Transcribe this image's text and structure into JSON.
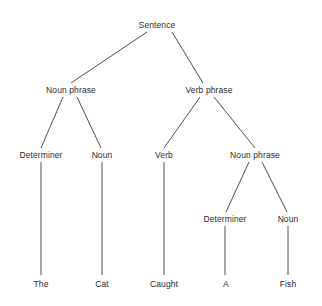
{
  "diagram": {
    "type": "parse-tree",
    "nodes": [
      {
        "id": "s",
        "label": "Sentence",
        "x": 157,
        "y": 25
      },
      {
        "id": "np1",
        "label": "Noun phrase",
        "x": 71,
        "y": 90
      },
      {
        "id": "vp",
        "label": "Verb phrase",
        "x": 209,
        "y": 90
      },
      {
        "id": "det1",
        "label": "Determiner",
        "x": 41,
        "y": 155
      },
      {
        "id": "n1",
        "label": "Noun",
        "x": 102,
        "y": 155
      },
      {
        "id": "v",
        "label": "Verb",
        "x": 164,
        "y": 155
      },
      {
        "id": "np2",
        "label": "Noun phrase",
        "x": 255,
        "y": 155
      },
      {
        "id": "det2",
        "label": "Determiner",
        "x": 225,
        "y": 219
      },
      {
        "id": "n2",
        "label": "Noun",
        "x": 288,
        "y": 219
      },
      {
        "id": "w1",
        "label": "The",
        "x": 41,
        "y": 284
      },
      {
        "id": "w2",
        "label": "Cat",
        "x": 102,
        "y": 284
      },
      {
        "id": "w3",
        "label": "Caught",
        "x": 164,
        "y": 284
      },
      {
        "id": "w4",
        "label": "A",
        "x": 226,
        "y": 284
      },
      {
        "id": "w5",
        "label": "Fish",
        "x": 288,
        "y": 284
      }
    ],
    "edges": [
      {
        "from": "s",
        "to": "np1",
        "x1": 147,
        "y1": 32,
        "x2": 71,
        "y2": 83
      },
      {
        "from": "s",
        "to": "vp",
        "x1": 172,
        "y1": 32,
        "x2": 203,
        "y2": 83
      },
      {
        "from": "np1",
        "to": "det1",
        "x1": 63,
        "y1": 97,
        "x2": 41,
        "y2": 148
      },
      {
        "from": "np1",
        "to": "n1",
        "x1": 77,
        "y1": 97,
        "x2": 101,
        "y2": 148
      },
      {
        "from": "vp",
        "to": "v",
        "x1": 200,
        "y1": 97,
        "x2": 164,
        "y2": 148
      },
      {
        "from": "vp",
        "to": "np2",
        "x1": 214,
        "y1": 97,
        "x2": 255,
        "y2": 148
      },
      {
        "from": "det1",
        "to": "w1",
        "x1": 41,
        "y1": 162,
        "x2": 41,
        "y2": 275
      },
      {
        "from": "n1",
        "to": "w2",
        "x1": 102,
        "y1": 162,
        "x2": 102,
        "y2": 275
      },
      {
        "from": "v",
        "to": "w3",
        "x1": 164,
        "y1": 162,
        "x2": 164,
        "y2": 275
      },
      {
        "from": "np2",
        "to": "det2",
        "x1": 249,
        "y1": 162,
        "x2": 226,
        "y2": 212
      },
      {
        "from": "np2",
        "to": "n2",
        "x1": 262,
        "y1": 162,
        "x2": 287,
        "y2": 212
      },
      {
        "from": "det2",
        "to": "w4",
        "x1": 225,
        "y1": 226,
        "x2": 225,
        "y2": 275
      },
      {
        "from": "n2",
        "to": "w5",
        "x1": 288,
        "y1": 226,
        "x2": 288,
        "y2": 275
      }
    ]
  }
}
